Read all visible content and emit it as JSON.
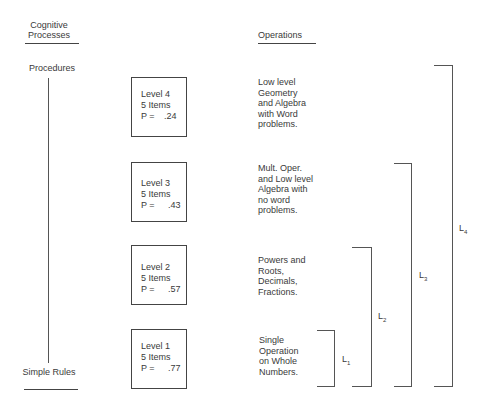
{
  "headers": {
    "cognitive_processes": "Cognitive Processes",
    "operations": "Operations"
  },
  "axis": {
    "top_label": "Procedures",
    "bottom_label": "Simple Rules"
  },
  "levels": [
    {
      "name": "Level 4",
      "items": "5 Items",
      "p_label": "P =",
      "p_value": ".24",
      "operations": "Low level\nGeometry\nand Algebra\nwith Word\nproblems."
    },
    {
      "name": "Level 3",
      "items": "5 Items",
      "p_label": "P =",
      "p_value": ".43",
      "operations": "Mult. Oper.\nand Low level\nAlgebra with\nno word\nproblems."
    },
    {
      "name": "Level 2",
      "items": "5 Items",
      "p_label": "P =",
      "p_value": ".57",
      "operations": "Powers and\nRoots,\nDecimals,\nFractions."
    },
    {
      "name": "Level 1",
      "items": "5 Items",
      "p_label": "P =",
      "p_value": ".77",
      "operations": "Single\nOperation\non Whole\nNumbers."
    }
  ],
  "brackets": [
    {
      "label": "L",
      "sub": "1"
    },
    {
      "label": "L",
      "sub": "2"
    },
    {
      "label": "L",
      "sub": "3"
    },
    {
      "label": "L",
      "sub": "4"
    }
  ]
}
